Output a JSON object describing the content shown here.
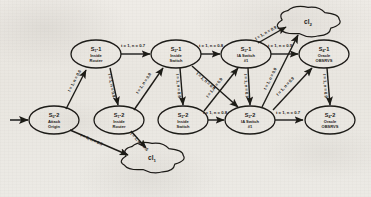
{
  "diagram": {
    "background_color": "#ece9e4",
    "ink_color": "#1d1b19",
    "nodes": [
      {
        "id": "n_origin",
        "state": "S",
        "state_sub": "0",
        "state_num": "2",
        "line1": "Attack",
        "line2": "Origin",
        "cx": 54,
        "cy": 120,
        "rx": 25,
        "ry": 14
      },
      {
        "id": "n_rt1",
        "state": "S",
        "state_sub": "1",
        "state_num": "1",
        "line1": "Inside",
        "line2": "Router",
        "cx": 96,
        "cy": 54,
        "rx": 25,
        "ry": 14
      },
      {
        "id": "n_rt2",
        "state": "S",
        "state_sub": "1",
        "state_num": "2",
        "line1": "Inside",
        "line2": "Router",
        "cx": 119,
        "cy": 120,
        "rx": 25,
        "ry": 14
      },
      {
        "id": "n_sw1",
        "state": "S",
        "state_sub": "2",
        "state_num": "1",
        "line1": "Inside",
        "line2": "Switch",
        "cx": 176,
        "cy": 54,
        "rx": 25,
        "ry": 14
      },
      {
        "id": "n_sw2",
        "state": "S",
        "state_sub": "2",
        "state_num": "2",
        "line1": "Inside",
        "line2": "Switch",
        "cx": 183,
        "cy": 120,
        "rx": 25,
        "ry": 14
      },
      {
        "id": "n_ia1",
        "state": "S",
        "state_sub": "3",
        "state_num": "1",
        "line1": "IA Switch",
        "line2": "#1",
        "cx": 246,
        "cy": 54,
        "rx": 25,
        "ry": 14
      },
      {
        "id": "n_ia2",
        "state": "S",
        "state_sub": "3",
        "state_num": "2",
        "line1": "IA Switch",
        "line2": "#1",
        "cx": 250,
        "cy": 120,
        "rx": 25,
        "ry": 14
      },
      {
        "id": "n_obs1",
        "state": "S",
        "state_sub": "4",
        "state_num": "1",
        "line1": "Oracle",
        "line2": "OBSRVS",
        "cx": 324,
        "cy": 54,
        "rx": 25,
        "ry": 14
      },
      {
        "id": "n_obs2",
        "state": "S",
        "state_sub": "4",
        "state_num": "2",
        "line1": "Oracle",
        "line2": "OBSRVS",
        "cx": 330,
        "cy": 120,
        "rx": 25,
        "ry": 14
      }
    ],
    "clouds": [
      {
        "id": "cl_top",
        "label": "cl",
        "label_sub": "2",
        "cx": 308,
        "cy": 22,
        "rx": 28,
        "ry": 13
      },
      {
        "id": "cl_bottom",
        "label": "cl",
        "label_sub": "1",
        "cx": 152,
        "cy": 158,
        "rx": 28,
        "ry": 13
      }
    ],
    "entry_arrow": {
      "from_x": 10,
      "to_x": 28,
      "y": 120
    },
    "edges": [
      {
        "id": "e_origin_rt1",
        "label": "t = 1, n = 0.6",
        "from": "n_origin",
        "to": "n_rt1",
        "x1": 66,
        "y1": 109,
        "x2": 86,
        "y2": 70,
        "lx": 70,
        "ly": 92,
        "rot": -62
      },
      {
        "id": "e_origin_cl1",
        "label": "t = 1, n = 0.5",
        "from": "n_origin",
        "to": "cl_bottom",
        "x1": 70,
        "y1": 130,
        "x2": 128,
        "y2": 155,
        "lx": 80,
        "ly": 136,
        "rot": 24
      },
      {
        "id": "e_rt1_sw1",
        "label": "t = 1, n = 0.7",
        "from": "n_rt1",
        "to": "n_sw1",
        "x1": 121,
        "y1": 54,
        "x2": 150,
        "y2": 54,
        "lx": 121,
        "ly": 47,
        "rot": 0
      },
      {
        "id": "e_rt1_rt2",
        "label": "t = 1, n = 0.9",
        "from": "n_rt1",
        "to": "n_rt2",
        "x1": 110,
        "y1": 68,
        "x2": 118,
        "y2": 105,
        "lx": 108,
        "ly": 74,
        "rot": 79
      },
      {
        "id": "e_rt2_sw1",
        "label": "t = 1, n = 0.8",
        "from": "n_rt2",
        "to": "n_sw1",
        "x1": 134,
        "y1": 110,
        "x2": 163,
        "y2": 68,
        "lx": 138,
        "ly": 94,
        "rot": -56
      },
      {
        "id": "e_rt2_cl1",
        "label": "t = 1, n = 0.6",
        "from": "n_rt2",
        "to": "cl_bottom",
        "x1": 131,
        "y1": 131,
        "x2": 146,
        "y2": 148,
        "lx": 130,
        "ly": 134,
        "rot": 46
      },
      {
        "id": "e_sw1_ia1",
        "label": "t = 1, n = 0.8",
        "from": "n_sw1",
        "to": "n_ia1",
        "x1": 201,
        "y1": 54,
        "x2": 220,
        "y2": 54,
        "lx": 199,
        "ly": 47,
        "rot": 0
      },
      {
        "id": "e_sw1_sw2",
        "label": "t = 1, n = 0.6",
        "from": "n_sw1",
        "to": "n_sw2",
        "x1": 180,
        "y1": 68,
        "x2": 183,
        "y2": 105,
        "lx": 176,
        "ly": 74,
        "rot": 85
      },
      {
        "id": "e_sw1_ia2",
        "label": "t = 1, n = 0.5",
        "from": "n_sw1",
        "to": "n_ia2",
        "x1": 192,
        "y1": 66,
        "x2": 238,
        "y2": 107,
        "lx": 196,
        "ly": 74,
        "rot": 42
      },
      {
        "id": "e_sw2_ia1",
        "label": "t = 1, n = 0.9",
        "from": "n_sw2",
        "to": "n_ia1",
        "x1": 204,
        "y1": 111,
        "x2": 238,
        "y2": 68,
        "lx": 208,
        "ly": 98,
        "rot": -52
      },
      {
        "id": "e_sw2_ia2",
        "label": "t = 1, n = 0.8",
        "from": "n_sw2",
        "to": "n_ia2",
        "x1": 208,
        "y1": 120,
        "x2": 224,
        "y2": 120,
        "lx": 203,
        "ly": 114,
        "rot": 0
      },
      {
        "id": "e_ia1_cl2",
        "label": "t = 1, n = 0.9",
        "from": "n_ia1",
        "to": "cl_top",
        "x1": 258,
        "y1": 43,
        "x2": 286,
        "y2": 27,
        "lx": 256,
        "ly": 40,
        "rot": -30
      },
      {
        "id": "e_ia1_ia2",
        "label": "t = 1, n = 0.7",
        "from": "n_ia1",
        "to": "n_ia2",
        "x1": 248,
        "y1": 68,
        "x2": 250,
        "y2": 105,
        "lx": 244,
        "ly": 74,
        "rot": 86
      },
      {
        "id": "e_ia1_obs1",
        "label": "t = 1, n = 0.9",
        "from": "n_ia1",
        "to": "n_obs1",
        "x1": 271,
        "y1": 54,
        "x2": 298,
        "y2": 54,
        "lx": 268,
        "ly": 47,
        "rot": 0
      },
      {
        "id": "e_ia2_cl2",
        "label": "t = 1, n = 0.9",
        "from": "n_ia2",
        "to": "cl_top",
        "x1": 262,
        "y1": 107,
        "x2": 298,
        "y2": 35,
        "lx": 266,
        "ly": 90,
        "rot": -63
      },
      {
        "id": "e_ia2_obs1",
        "label": "t = 1, n = 0.9",
        "from": "n_ia2",
        "to": "n_obs1",
        "x1": 273,
        "y1": 110,
        "x2": 312,
        "y2": 68,
        "lx": 278,
        "ly": 96,
        "rot": -47
      },
      {
        "id": "e_ia2_obs2",
        "label": "t = 1, n = 0.7",
        "from": "n_ia2",
        "to": "n_obs2",
        "x1": 275,
        "y1": 120,
        "x2": 303,
        "y2": 120,
        "lx": 276,
        "ly": 114,
        "rot": 0
      },
      {
        "id": "e_obs1_obs2",
        "label": "t = 1, n = 0.9",
        "from": "n_obs1",
        "to": "n_obs2",
        "x1": 327,
        "y1": 68,
        "x2": 330,
        "y2": 105,
        "lx": 323,
        "ly": 74,
        "rot": 86
      }
    ]
  }
}
